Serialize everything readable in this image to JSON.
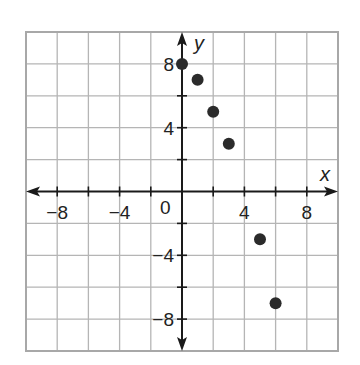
{
  "chart_data": {
    "type": "scatter",
    "title": "",
    "xlabel": "x",
    "ylabel": "y",
    "xlim": [
      -10,
      10
    ],
    "ylim": [
      -10,
      10
    ],
    "grid": true,
    "grid_step": 2,
    "legend": null,
    "x_tick_labels": [
      "-8",
      "-4",
      "0",
      "4",
      "8"
    ],
    "y_tick_labels": [
      "8",
      "4",
      "-4",
      "-8"
    ],
    "series": [
      {
        "name": "points",
        "points": [
          {
            "x": 0,
            "y": 8
          },
          {
            "x": 1,
            "y": 7
          },
          {
            "x": 2,
            "y": 5
          },
          {
            "x": 3,
            "y": 3
          },
          {
            "x": 5,
            "y": -3
          },
          {
            "x": 6,
            "y": -7
          }
        ]
      }
    ]
  },
  "axes": {
    "x_name": "x",
    "y_name": "y",
    "origin_label": "0",
    "x_ticks": [
      {
        "value": -8,
        "label": "−8"
      },
      {
        "value": -4,
        "label": "−4"
      },
      {
        "value": 4,
        "label": "4"
      },
      {
        "value": 8,
        "label": "8"
      }
    ],
    "y_ticks": [
      {
        "value": 8,
        "label": "8"
      },
      {
        "value": 4,
        "label": "4"
      },
      {
        "value": -4,
        "label": "−4"
      },
      {
        "value": -8,
        "label": "−8"
      }
    ]
  },
  "colors": {
    "grid": "#b5b5b5",
    "border": "#a8a8a8",
    "axis": "#1a1a1a",
    "point": "#2b2b2b"
  }
}
